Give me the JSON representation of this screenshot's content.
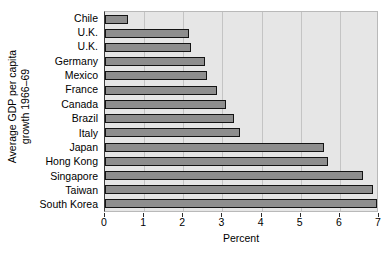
{
  "chart_data": {
    "type": "bar",
    "orientation": "horizontal",
    "title": "",
    "xlabel": "Percent",
    "ylabel": "Average GDP per capita growth 1966–69",
    "ylabel_lines": [
      "Average GDP per capita",
      "growth 1966–69"
    ],
    "categories": [
      "Chile",
      "U.K.",
      "U.K.",
      "Germany",
      "Mexico",
      "France",
      "Canada",
      "Brazil",
      "Italy",
      "Japan",
      "Hong Kong",
      "Singapore",
      "Taiwan",
      "South Korea"
    ],
    "values": [
      0.6,
      2.15,
      2.2,
      2.55,
      2.6,
      2.85,
      3.1,
      3.3,
      3.45,
      5.6,
      5.7,
      6.6,
      6.85,
      6.95
    ],
    "xlim": [
      0,
      7
    ],
    "xticks": [
      0,
      1,
      2,
      3,
      4,
      5,
      6,
      7
    ],
    "xtick_labels": [
      "0",
      "1",
      "2",
      "3",
      "4",
      "5",
      "6",
      "7"
    ],
    "grid": "vertical",
    "legend": "none",
    "colors": {
      "bar_fill": "#8e8e8e",
      "bar_edge": "#141414",
      "plot_background": "#e6e6e6",
      "gridline": "#c4c4c4",
      "figure_background": "#ffffff",
      "text": "#000000"
    }
  }
}
